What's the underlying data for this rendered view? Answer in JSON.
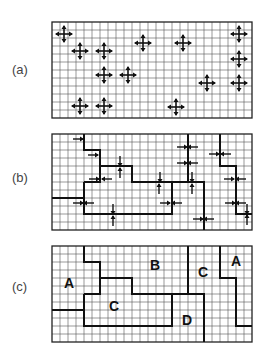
{
  "figure": {
    "grid": {
      "cols": 25,
      "rows": 12,
      "cell": 8,
      "left": 52,
      "line_color": "#555555",
      "border_color": "#222222",
      "boundary_color": "#111111"
    },
    "panels": [
      {
        "id": "a",
        "label": "(a)",
        "top": 22,
        "label_x": 12,
        "label_y": 62,
        "crosses": [
          [
            64,
            34
          ],
          [
            80,
            51
          ],
          [
            104,
            51
          ],
          [
            143,
            43
          ],
          [
            183,
            43
          ],
          [
            239,
            34
          ],
          [
            239,
            59
          ],
          [
            104,
            75
          ],
          [
            128,
            75
          ],
          [
            207,
            83
          ],
          [
            239,
            83
          ],
          [
            80,
            106
          ],
          [
            104,
            106
          ],
          [
            176,
            107
          ]
        ]
      },
      {
        "id": "b",
        "label": "(b)",
        "top": 134,
        "label_x": 12,
        "label_y": 170,
        "arrows": [
          [
            78,
            139,
            "right"
          ],
          [
            93,
            155,
            "right"
          ],
          [
            120,
            161,
            "down"
          ],
          [
            120,
            173,
            "up"
          ],
          [
            94,
            179,
            "right"
          ],
          [
            107,
            179,
            "left"
          ],
          [
            160,
            177,
            "down"
          ],
          [
            159,
            189,
            "up"
          ],
          [
            182,
            147,
            "right"
          ],
          [
            193,
            147,
            "left"
          ],
          [
            182,
            163,
            "right"
          ],
          [
            193,
            163,
            "left"
          ],
          [
            192,
            177,
            "down"
          ],
          [
            192,
            189,
            "up"
          ],
          [
            214,
            154,
            "right"
          ],
          [
            226,
            154,
            "left"
          ],
          [
            229,
            179,
            "right"
          ],
          [
            241,
            179,
            "left"
          ],
          [
            78,
            203,
            "right"
          ],
          [
            89,
            203,
            "left"
          ],
          [
            113,
            209,
            "down"
          ],
          [
            113,
            221,
            "up"
          ],
          [
            165,
            203,
            "right"
          ],
          [
            177,
            203,
            "left"
          ],
          [
            230,
            203,
            "right"
          ],
          [
            241,
            203,
            "left"
          ],
          [
            247,
            209,
            "down"
          ],
          [
            247,
            220,
            "up"
          ],
          [
            198,
            219,
            "right"
          ],
          [
            209,
            219,
            "left"
          ]
        ]
      },
      {
        "id": "c",
        "label": "(c)",
        "top": 246,
        "label_x": 12,
        "label_y": 279,
        "regions": [
          {
            "text": "A",
            "x": 69,
            "y": 288
          },
          {
            "text": "B",
            "x": 155,
            "y": 270
          },
          {
            "text": "C",
            "x": 114,
            "y": 311
          },
          {
            "text": "C",
            "x": 203,
            "y": 277
          },
          {
            "text": "A",
            "x": 236,
            "y": 266
          },
          {
            "text": "D",
            "x": 187,
            "y": 325
          }
        ]
      }
    ],
    "boundaries_cells": [
      [
        [
          4,
          0
        ],
        [
          4,
          2
        ],
        [
          6,
          2
        ],
        [
          6,
          4
        ],
        [
          10,
          4
        ],
        [
          10,
          6
        ],
        [
          15,
          6
        ]
      ],
      [
        [
          0,
          8
        ],
        [
          4,
          8
        ]
      ],
      [
        [
          4,
          6
        ],
        [
          6,
          6
        ],
        [
          6,
          4
        ]
      ],
      [
        [
          4,
          6
        ],
        [
          4,
          10
        ],
        [
          15,
          10
        ],
        [
          15,
          6
        ],
        [
          19,
          6
        ],
        [
          19,
          12
        ]
      ],
      [
        [
          17,
          0
        ],
        [
          17,
          6
        ]
      ],
      [
        [
          21,
          0
        ],
        [
          21,
          4
        ],
        [
          23,
          4
        ],
        [
          23,
          10
        ],
        [
          25,
          10
        ]
      ]
    ]
  }
}
